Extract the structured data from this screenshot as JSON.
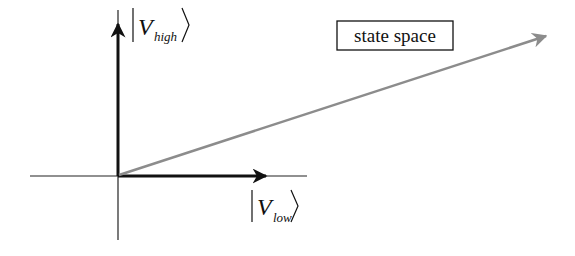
{
  "diagram": {
    "title_box": {
      "text": "state space"
    },
    "axes": {
      "vertical_label": {
        "symbol": "V",
        "subscript": "high"
      },
      "horizontal_label": {
        "symbol": "V",
        "subscript": "low"
      }
    },
    "vectors": [
      {
        "name": "basis-high",
        "color": "#111111"
      },
      {
        "name": "basis-low",
        "color": "#111111"
      },
      {
        "name": "state-vector",
        "color": "#8c8c8c"
      }
    ],
    "colors": {
      "axis": "#222222",
      "basis": "#111111",
      "state": "#8c8c8c",
      "background": "#ffffff"
    }
  }
}
